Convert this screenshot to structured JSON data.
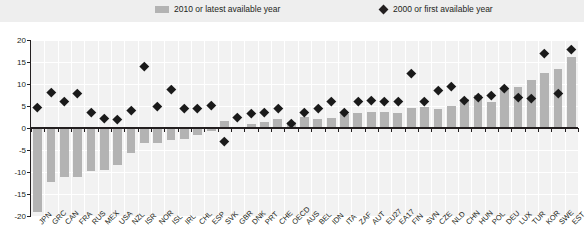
{
  "legend": {
    "bars_label": "2010 or latest available year",
    "diamonds_label": "2000 or first available year",
    "bar_icon": "bar-swatch-icon",
    "diamond_icon": "diamond-swatch-icon"
  },
  "colors": {
    "bar": "#b3b3b3",
    "marker": "#231f20",
    "plot_background": "#f2f2f2",
    "legend_background": "#eeeeee",
    "gridline": "#ffffff",
    "axis": "#231f20"
  },
  "chart_data": {
    "type": "bar",
    "title": "",
    "xlabel": "",
    "ylabel": "",
    "ylim": [
      -20,
      20
    ],
    "yticks": [
      20,
      15,
      10,
      5,
      0,
      -5,
      -10,
      -15,
      -20
    ],
    "grid": true,
    "legend_position": "top",
    "categories": [
      "JPN",
      "GRC",
      "CAN",
      "FRA",
      "RUS",
      "MEX",
      "USA",
      "NZL",
      "ISR",
      "NOR",
      "ISL",
      "IRL",
      "CHL",
      "ESP",
      "SVK",
      "GBR",
      "DNK",
      "PRT",
      "CHE",
      "OECD",
      "AUS",
      "BEL",
      "IDN",
      "ITA",
      "ZAF",
      "AUT",
      "EU27",
      "EA17",
      "FIN",
      "SVN",
      "CZE",
      "NLD",
      "CHN",
      "HUN",
      "POL",
      "DEU",
      "LUX",
      "TUR",
      "KOR",
      "SWE",
      "EST"
    ],
    "series": [
      {
        "name": "2010 or latest available year",
        "type": "bar",
        "values": [
          -19.0,
          -12.3,
          -11.2,
          -11.2,
          -9.8,
          -9.5,
          -8.3,
          -5.6,
          -3.4,
          -3.3,
          -2.8,
          -2.5,
          -1.6,
          -0.6,
          1.5,
          0.3,
          1.0,
          1.3,
          2.0,
          1.3,
          2.5,
          2.0,
          2.3,
          3.2,
          3.3,
          3.7,
          3.6,
          3.5,
          4.5,
          4.7,
          4.4,
          5.0,
          6.6,
          7.6,
          6.0,
          8.8,
          9.3,
          11.0,
          12.5,
          13.5,
          16.2
        ]
      },
      {
        "name": "2000 or first available year",
        "type": "scatter",
        "values": [
          4.7,
          8.2,
          6.0,
          8.0,
          3.5,
          2.2,
          2.0,
          4.0,
          14.0,
          5.0,
          8.8,
          4.5,
          4.5,
          5.2,
          -3.0,
          2.5,
          3.3,
          3.5,
          4.5,
          1.0,
          3.5,
          4.5,
          6.0,
          3.5,
          6.0,
          6.2,
          6.0,
          6.0,
          12.5,
          6.0,
          8.5,
          9.5,
          6.2,
          7.0,
          7.5,
          9.0,
          7.0,
          6.8,
          17.0,
          8.0,
          18.0
        ]
      }
    ]
  }
}
